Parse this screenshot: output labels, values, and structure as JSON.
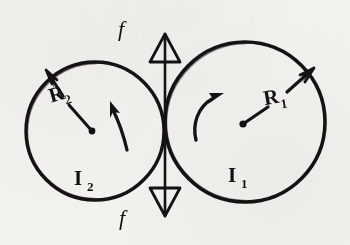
{
  "diagram": {
    "kind": "hand-drawn-physics-sketch",
    "ink_color": "#151311",
    "paper_color": "#f3f1ed",
    "labels": {
      "force_top": "f",
      "force_bottom": "f",
      "left_radius_main": "R",
      "left_radius_sub": "2",
      "right_radius_main": "R",
      "right_radius_sub": "1",
      "left_inertia_main": "I",
      "left_inertia_sub": "2",
      "right_inertia_main": "I",
      "right_inertia_sub": "1"
    },
    "shapes": {
      "left_circle": {
        "cx": 95,
        "cy": 131,
        "r": 69
      },
      "right_circle": {
        "cx": 245,
        "cy": 122,
        "r": 80
      },
      "contact_point": {
        "x": 165,
        "y": 124
      },
      "force_axis_x": 165,
      "force_axis_top_y": 34,
      "force_axis_bottom_y": 216
    }
  }
}
